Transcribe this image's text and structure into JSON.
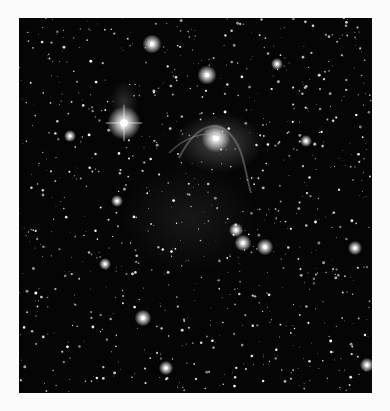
{
  "image": {
    "subject": "star field with nebula",
    "background_color": "#fbfbfb",
    "frame": {
      "x": 19,
      "y": 18,
      "w": 353,
      "h": 375,
      "color": "#050505"
    },
    "bright_stars": [
      {
        "x": 105,
        "y": 105,
        "r": 7,
        "spikes": true
      },
      {
        "x": 197,
        "y": 120,
        "r": 6,
        "spikes": false
      },
      {
        "x": 188,
        "y": 57,
        "r": 4,
        "spikes": false
      },
      {
        "x": 133,
        "y": 26,
        "r": 4,
        "spikes": false
      },
      {
        "x": 224,
        "y": 225,
        "r": 3.5,
        "spikes": false
      },
      {
        "x": 246,
        "y": 229,
        "r": 3.5,
        "spikes": false
      },
      {
        "x": 217,
        "y": 212,
        "r": 3,
        "spikes": false
      },
      {
        "x": 336,
        "y": 230,
        "r": 3,
        "spikes": false
      },
      {
        "x": 348,
        "y": 347,
        "r": 3,
        "spikes": false
      },
      {
        "x": 124,
        "y": 300,
        "r": 3.5,
        "spikes": false
      },
      {
        "x": 147,
        "y": 350,
        "r": 3,
        "spikes": false
      },
      {
        "x": 86,
        "y": 246,
        "r": 2.5,
        "spikes": false
      },
      {
        "x": 51,
        "y": 118,
        "r": 2.5,
        "spikes": false
      },
      {
        "x": 258,
        "y": 46,
        "r": 2.5,
        "spikes": false
      },
      {
        "x": 287,
        "y": 123,
        "r": 2.5,
        "spikes": false
      },
      {
        "x": 98,
        "y": 183,
        "r": 2.5,
        "spikes": false
      }
    ],
    "nebula": [
      {
        "cx": 200,
        "cy": 125,
        "rx": 45,
        "ry": 30,
        "opacity": 0.35
      },
      {
        "cx": 105,
        "cy": 85,
        "rx": 14,
        "ry": 22,
        "opacity": 0.22
      },
      {
        "cx": 170,
        "cy": 200,
        "rx": 70,
        "ry": 55,
        "opacity": 0.1
      }
    ],
    "faint_star_count": 900,
    "seed": 7
  }
}
